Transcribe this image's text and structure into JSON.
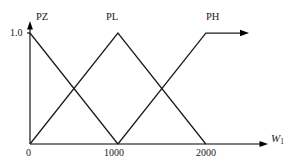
{
  "figure": {
    "background_color": "#ffffff",
    "line_color": "#1a1a1a"
  },
  "axes": {
    "x_axis_name": "W",
    "x_axis_subscript": "1",
    "y_top_label": "1.0",
    "x_tick_labels": [
      "0",
      "1000",
      "2000"
    ],
    "x_tick_values": [
      0,
      1000,
      2000
    ],
    "y_tick_labels": [
      "1.0"
    ],
    "y_tick_values": [
      1.0
    ]
  },
  "sets": {
    "pz": {
      "label": "PZ"
    },
    "pl": {
      "label": "PL"
    },
    "ph": {
      "label": "PH"
    }
  },
  "chart_data": {
    "type": "line",
    "xlabel": "W1",
    "ylabel": "membership",
    "xlim": [
      0,
      2400
    ],
    "ylim": [
      0,
      1.0
    ],
    "grid": false,
    "legend": "inline-labels",
    "x_ticks": [
      0,
      1000,
      2000
    ],
    "x_tick_labels": [
      "0",
      "1000",
      "2000"
    ],
    "y_ticks": [
      1.0
    ],
    "y_tick_labels": [
      "1.0"
    ],
    "annotations": [
      {
        "text": "PZ",
        "x": 120,
        "y": 1.08
      },
      {
        "text": "PL",
        "x": 950,
        "y": 1.08
      },
      {
        "text": "PH",
        "x": 2030,
        "y": 1.08
      },
      {
        "text": "W1",
        "x": 2390,
        "y": 0.06
      }
    ],
    "series": [
      {
        "name": "PZ",
        "type": "trapezoid-descending",
        "x": [
          0,
          1000
        ],
        "values": [
          1.0,
          0.0
        ],
        "points": [
          [
            0,
            1.0
          ],
          [
            1000,
            0.0
          ]
        ]
      },
      {
        "name": "PL",
        "type": "triangle",
        "x": [
          0,
          1000,
          2000
        ],
        "values": [
          0.0,
          1.0,
          0.0
        ],
        "points": [
          [
            0,
            0.0
          ],
          [
            1000,
            1.0
          ],
          [
            2000,
            0.0
          ]
        ]
      },
      {
        "name": "PH",
        "type": "trapezoid-ascending",
        "x": [
          1000,
          2000,
          2400
        ],
        "values": [
          0.0,
          1.0,
          1.0
        ],
        "points": [
          [
            1000,
            0.0
          ],
          [
            2000,
            1.0
          ],
          [
            2400,
            1.0
          ]
        ]
      }
    ]
  }
}
